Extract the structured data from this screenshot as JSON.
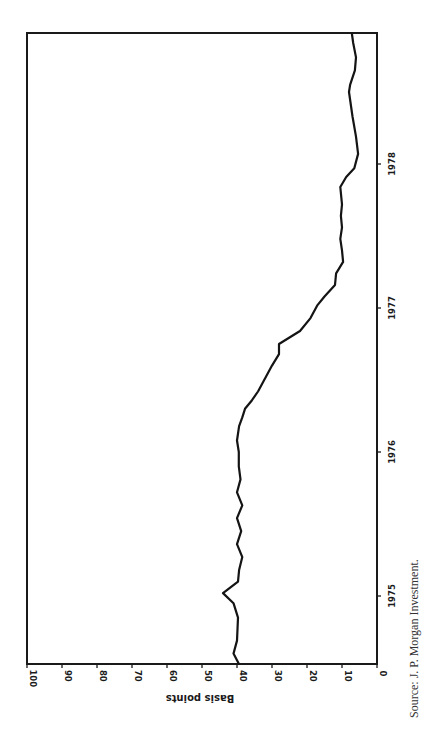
{
  "chart_data": {
    "type": "line",
    "orientation": "rotated 90 degrees (time axis runs bottom-to-top, value axis runs right-to-left along bottom edge)",
    "title": "",
    "xlabel": "",
    "ylabel": "Basis points",
    "ylim": [
      0,
      100
    ],
    "y_ticks": [
      100,
      90,
      80,
      70,
      60,
      50,
      40,
      30,
      20,
      10,
      0
    ],
    "x_ticks": [
      {
        "label": "1975",
        "value": 1975
      },
      {
        "label": "1976",
        "value": 1976
      },
      {
        "label": "1977",
        "value": 1977
      },
      {
        "label": "1978",
        "value": 1978
      }
    ],
    "xlim": [
      1974.53,
      1978.91
    ],
    "grid": false,
    "legend": null,
    "series": [
      {
        "name": "Basis points",
        "x": [
          1974.53,
          1974.6,
          1974.69,
          1974.85,
          1974.95,
          1975.02,
          1975.1,
          1975.18,
          1975.27,
          1975.36,
          1975.45,
          1975.54,
          1975.63,
          1975.72,
          1975.81,
          1975.9,
          1976.0,
          1976.08,
          1976.18,
          1976.24,
          1976.3,
          1976.36,
          1976.42,
          1976.6,
          1976.68,
          1976.75,
          1976.84,
          1976.93,
          1977.02,
          1977.08,
          1977.16,
          1977.24,
          1977.32,
          1977.4,
          1977.48,
          1977.56,
          1977.64,
          1977.72,
          1977.84,
          1977.91,
          1977.97,
          1978.07,
          1978.19,
          1978.33,
          1978.5,
          1978.55,
          1978.65,
          1978.74,
          1978.84,
          1978.91
        ],
        "values": [
          39.5,
          41.0,
          40.0,
          39.7,
          41.0,
          44.0,
          39.7,
          39.4,
          38.5,
          40.0,
          38.8,
          40.0,
          38.5,
          40.0,
          39.0,
          39.5,
          39.5,
          40.0,
          39.4,
          38.5,
          37.7,
          35.7,
          34.0,
          30.0,
          28.0,
          28.0,
          22.0,
          19.0,
          17.0,
          15.0,
          12.0,
          11.7,
          9.7,
          10.0,
          10.5,
          10.0,
          10.3,
          10.0,
          10.5,
          8.8,
          6.5,
          5.4,
          6.0,
          7.0,
          8.0,
          7.7,
          6.3,
          6.0,
          6.8,
          7.2
        ]
      }
    ],
    "source_note": "Source: J. P. Morgan Investment."
  },
  "labels": {
    "axis_title": "Basis points",
    "source": "Source: J. P. Morgan Investment."
  }
}
